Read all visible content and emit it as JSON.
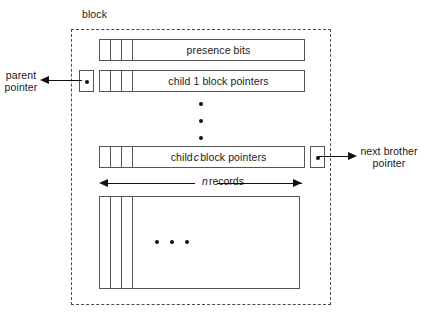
{
  "figure": {
    "block_caption": "block",
    "rows": [
      {
        "name": "presence-bits",
        "label": "presence bits",
        "cells": 3
      },
      {
        "name": "child-1-block-pointers",
        "label_prefix": "child 1 block pointers",
        "cells": 3
      },
      {
        "name": "child-c-block-pointers",
        "label_before": "child",
        "label_italic": "c",
        "label_after": "block pointers",
        "cells": 3
      }
    ],
    "labels": {
      "presence_bits": "presence bits",
      "child_one_block_pointers": "child 1 block pointers",
      "child_c_prefix": "child",
      "child_c_italic": "c",
      "child_c_suffix": "block pointers",
      "parent_pointer_line1": "parent",
      "parent_pointer_line2": "pointer",
      "next_brother_line1": "next brother",
      "next_brother_line2": "pointer",
      "n_records_italic": "n",
      "n_records_text": "records"
    },
    "ellipsis": {
      "vertical_dots": 3,
      "horizontal_dots": 3
    },
    "records_box": {
      "columns": 3
    },
    "colors": {
      "stroke": "#555555",
      "dashed_boundary": "#4a4a4a",
      "arrow": "#111111",
      "text": "#1a1a1a",
      "background": "#ffffff"
    }
  }
}
